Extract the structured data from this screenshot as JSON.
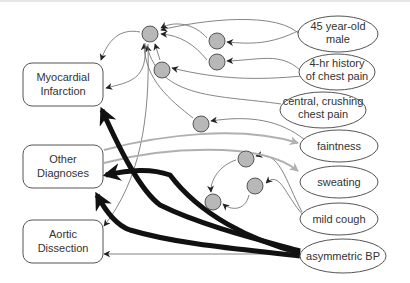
{
  "diagram": {
    "type": "causal-network",
    "colors": {
      "background": "#ffffff",
      "node_stroke": "#444444",
      "hidden_node_fill": "#b8b8b8",
      "thin_edge": "#777777",
      "gray_edge": "#b0b0b0",
      "thick_edge": "#111111",
      "text": "#333333"
    },
    "diagnoses": [
      {
        "id": "mi",
        "line1": "Myocardial",
        "line2": "Infarction"
      },
      {
        "id": "other",
        "line1": "Other",
        "line2": "Diagnoses"
      },
      {
        "id": "ad",
        "line1": "Aortic",
        "line2": "Dissection"
      }
    ],
    "findings": [
      {
        "id": "age",
        "line1": "45 year-old",
        "line2": "male"
      },
      {
        "id": "history",
        "line1": "4-hr history",
        "line2": "of chest pain"
      },
      {
        "id": "pain",
        "line1": "central, crushing",
        "line2": "chest pain"
      },
      {
        "id": "faint",
        "line1": "faintness",
        "line2": ""
      },
      {
        "id": "sweat",
        "line1": "sweating",
        "line2": ""
      },
      {
        "id": "cough",
        "line1": "mild cough",
        "line2": ""
      },
      {
        "id": "bp",
        "line1": "asymmetric BP",
        "line2": ""
      }
    ],
    "hidden_nodes": 8,
    "edge_types": [
      "thin",
      "gray",
      "thick"
    ]
  }
}
